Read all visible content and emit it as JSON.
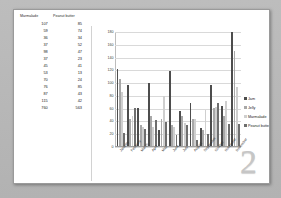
{
  "page": {
    "number_watermark": "2"
  },
  "table": {
    "headers": [
      "Marmalade",
      "Peanut butter"
    ],
    "rows": [
      [
        "107",
        "85"
      ],
      [
        "59",
        "74"
      ],
      [
        "36",
        "34"
      ],
      [
        "37",
        "52"
      ],
      [
        "98",
        "47"
      ],
      [
        "37",
        "23"
      ],
      [
        "45",
        "41"
      ],
      [
        "53",
        "13"
      ],
      [
        "70",
        "24"
      ],
      [
        "76",
        "85"
      ],
      [
        "87",
        "43"
      ],
      [
        "115",
        "42"
      ],
      [
        "760",
        "563"
      ]
    ]
  },
  "legend": {
    "items": [
      {
        "label": "Jam",
        "color": "#4d4d4d"
      },
      {
        "label": "Jelly",
        "color": "#a8a8a8"
      },
      {
        "label": "Marmalade",
        "color": "#cfcfcf"
      },
      {
        "label": "Peanut butter",
        "color": "#6e6e6e"
      }
    ]
  },
  "chart_data": {
    "type": "bar",
    "title": "",
    "xlabel": "",
    "ylabel": "",
    "ylim": [
      0,
      180
    ],
    "yticks": [
      0,
      20,
      40,
      60,
      80,
      100,
      120,
      140,
      160,
      180
    ],
    "grid": true,
    "legend_position": "right",
    "categories": [
      "January",
      "February",
      "March",
      "April",
      "May",
      "June",
      "July",
      "August",
      "September",
      "October",
      "November",
      "December"
    ],
    "series": [
      {
        "name": "Jam",
        "color": "#4d4d4d",
        "values": [
          120,
          95,
          60,
          98,
          25,
          118,
          55,
          68,
          28,
          95,
          62,
          178
        ]
      },
      {
        "name": "Jelly",
        "color": "#a8a8a8",
        "values": [
          105,
          42,
          33,
          47,
          42,
          33,
          47,
          42,
          25,
          60,
          47,
          148
        ]
      },
      {
        "name": "Marmalade",
        "color": "#cfcfcf",
        "values": [
          85,
          47,
          30,
          30,
          78,
          30,
          36,
          42,
          56,
          61,
          70,
          92
        ]
      },
      {
        "name": "Peanut butter",
        "color": "#6e6e6e",
        "values": [
          20,
          59,
          27,
          41,
          38,
          18,
          33,
          10,
          19,
          68,
          34,
          34
        ]
      }
    ]
  }
}
